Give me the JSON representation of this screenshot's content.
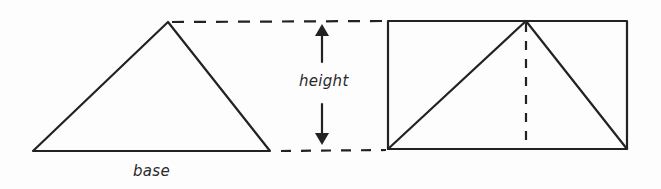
{
  "diagram": {
    "labels": {
      "height": "height",
      "base": "base"
    },
    "colors": {
      "stroke": "#222222",
      "background": "#fdfdfd"
    },
    "shapes": {
      "left_triangle": {
        "points": [
          [
            33,
            151
          ],
          [
            168,
            22
          ],
          [
            270,
            151
          ]
        ]
      },
      "rectangle": {
        "x": 388,
        "y": 21,
        "width": 239,
        "height": 128
      },
      "inner_triangle": {
        "points": [
          [
            388,
            149
          ],
          [
            526,
            21
          ],
          [
            627,
            149
          ]
        ]
      },
      "altitude_dashed": {
        "x": 526,
        "y1": 21,
        "y2": 149
      },
      "top_guide_dashed": {
        "x1": 170,
        "y1": 22,
        "x2": 388,
        "y2": 21
      },
      "bottom_guide_dashed": {
        "x1": 280,
        "y1": 151,
        "x2": 388,
        "y2": 150
      },
      "height_arrow": {
        "x": 322,
        "y_top": 24,
        "y_bottom": 145
      }
    }
  }
}
